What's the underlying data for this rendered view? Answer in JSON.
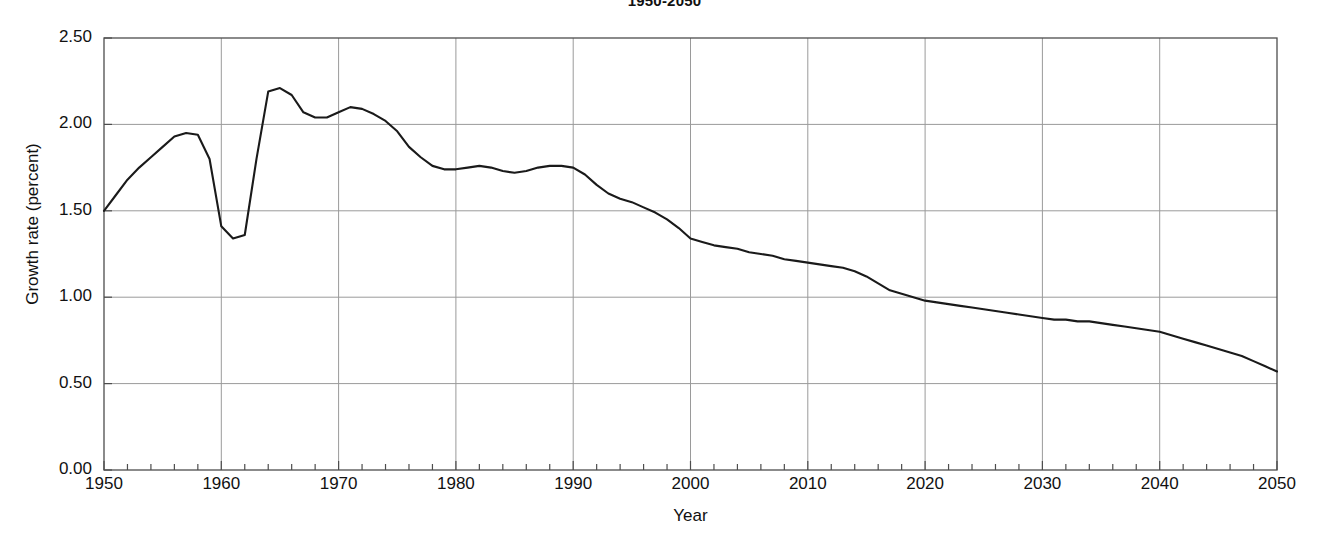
{
  "chart_data": {
    "type": "line",
    "title": "1950-2050",
    "xlabel": "Year",
    "ylabel": "Growth rate (percent)",
    "xlim": [
      1950,
      2050
    ],
    "ylim": [
      0.0,
      2.5
    ],
    "grid": true,
    "legend": null,
    "line_color": "#1a1a1a",
    "grid_color": "#9a9a9a",
    "axis_color": "#4d4d4d",
    "x_major_ticks": [
      1950,
      1960,
      1970,
      1980,
      1990,
      2000,
      2010,
      2020,
      2030,
      2040,
      2050
    ],
    "x_tick_labels": [
      "1950",
      "1960",
      "1970",
      "1980",
      "1990",
      "2000",
      "2010",
      "2020",
      "2030",
      "2040",
      "2050"
    ],
    "x_minor_tick_interval": 2,
    "y_major_ticks": [
      0.0,
      0.5,
      1.0,
      1.5,
      2.0,
      2.5
    ],
    "y_tick_labels": [
      "0.00",
      "0.50",
      "1.00",
      "1.50",
      "2.00",
      "2.50"
    ],
    "series": [
      {
        "name": "World population growth rate",
        "x": [
          1950,
          1951,
          1952,
          1953,
          1954,
          1955,
          1956,
          1957,
          1958,
          1959,
          1960,
          1961,
          1962,
          1963,
          1964,
          1965,
          1966,
          1967,
          1968,
          1969,
          1970,
          1971,
          1972,
          1973,
          1974,
          1975,
          1976,
          1977,
          1978,
          1979,
          1980,
          1981,
          1982,
          1983,
          1984,
          1985,
          1986,
          1987,
          1988,
          1989,
          1990,
          1991,
          1992,
          1993,
          1994,
          1995,
          1996,
          1997,
          1998,
          1999,
          2000,
          2001,
          2002,
          2003,
          2004,
          2005,
          2006,
          2007,
          2008,
          2009,
          2010,
          2011,
          2012,
          2013,
          2014,
          2015,
          2016,
          2017,
          2018,
          2019,
          2020,
          2021,
          2022,
          2023,
          2024,
          2025,
          2026,
          2027,
          2028,
          2029,
          2030,
          2031,
          2032,
          2033,
          2034,
          2035,
          2036,
          2037,
          2038,
          2039,
          2040,
          2041,
          2042,
          2043,
          2044,
          2045,
          2046,
          2047,
          2048,
          2049,
          2050
        ],
        "values": [
          1.5,
          1.59,
          1.68,
          1.75,
          1.81,
          1.87,
          1.93,
          1.95,
          1.94,
          1.8,
          1.41,
          1.34,
          1.36,
          1.8,
          2.19,
          2.21,
          2.17,
          2.07,
          2.04,
          2.04,
          2.07,
          2.1,
          2.09,
          2.06,
          2.02,
          1.96,
          1.87,
          1.81,
          1.76,
          1.74,
          1.74,
          1.75,
          1.76,
          1.75,
          1.73,
          1.72,
          1.73,
          1.75,
          1.76,
          1.76,
          1.75,
          1.71,
          1.65,
          1.6,
          1.57,
          1.55,
          1.52,
          1.49,
          1.45,
          1.4,
          1.34,
          1.32,
          1.3,
          1.29,
          1.28,
          1.26,
          1.25,
          1.24,
          1.22,
          1.21,
          1.2,
          1.19,
          1.18,
          1.17,
          1.15,
          1.12,
          1.08,
          1.04,
          1.02,
          1.0,
          0.98,
          0.97,
          0.96,
          0.95,
          0.94,
          0.93,
          0.92,
          0.91,
          0.9,
          0.89,
          0.88,
          0.87,
          0.87,
          0.86,
          0.86,
          0.85,
          0.84,
          0.83,
          0.82,
          0.81,
          0.8,
          0.78,
          0.76,
          0.74,
          0.72,
          0.7,
          0.68,
          0.66,
          0.63,
          0.6,
          0.57
        ]
      }
    ]
  }
}
